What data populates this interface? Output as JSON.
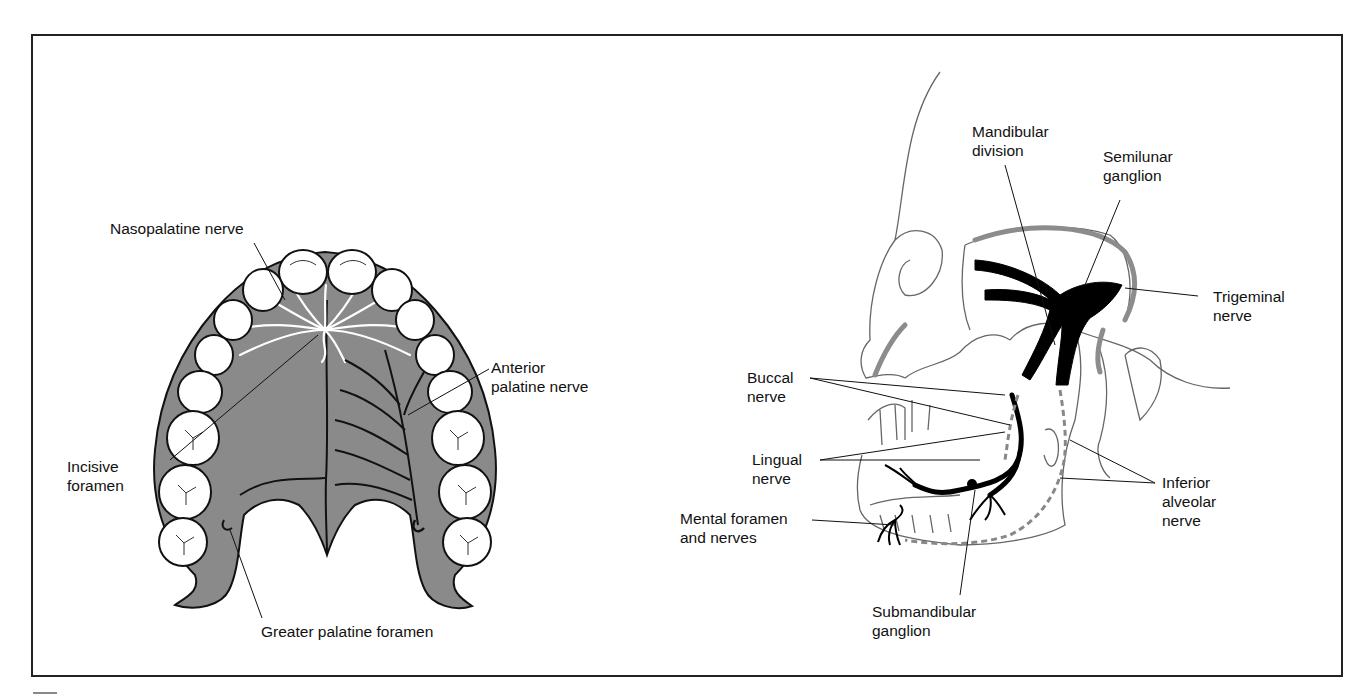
{
  "figure": {
    "colors": {
      "frame": "#222222",
      "palate_fill": "#8a8a8a",
      "nerve_black": "#000000",
      "nerve_white": "#ffffff",
      "outline": "#111111",
      "skull_line": "#666666",
      "accent_gray": "#8c8c8c"
    },
    "left_panel": {
      "subject": "palate-view",
      "labels": {
        "nasopalatine": "Nasopalatine nerve",
        "anterior_palatine_1": "Anterior",
        "anterior_palatine_2": "palatine nerve",
        "incisive_1": "Incisive",
        "incisive_2": "foramen",
        "greater_palatine": "Greater palatine foramen"
      }
    },
    "right_panel": {
      "subject": "skull-lateral-view",
      "labels": {
        "mandibular_1": "Mandibular",
        "mandibular_2": "division",
        "semilunar_1": "Semilunar",
        "semilunar_2": "ganglion",
        "trigeminal_1": "Trigeminal",
        "trigeminal_2": "nerve",
        "buccal_1": "Buccal",
        "buccal_2": "nerve",
        "lingual_1": "Lingual",
        "lingual_2": "nerve",
        "mental_1": "Mental foramen",
        "mental_2": "and nerves",
        "inferior_1": "Inferior",
        "inferior_2": "alveolar",
        "inferior_3": "nerve",
        "submandibular_1": "Submandibular",
        "submandibular_2": "ganglion"
      }
    }
  }
}
